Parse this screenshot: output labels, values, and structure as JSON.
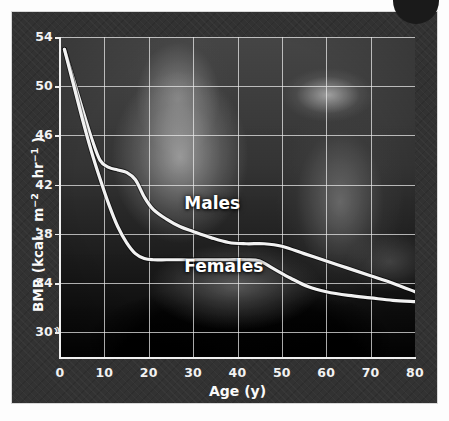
{
  "figure": {
    "panel_bg": "#323232",
    "curve_color": "#f2f2f2",
    "grid_color": "#ebebeb"
  },
  "corner": {
    "icon": "page-corner-dot"
  },
  "chart_data": {
    "type": "line",
    "title": "",
    "xlabel": "Age (y)",
    "ylabel": "BMR (kcal · m⁻² · hr⁻¹)",
    "ylabel_parts": {
      "prefix": "BMR (kcal · m",
      "sup1": "−2",
      "mid": " · hr",
      "sup2": "−1",
      "suffix": " )"
    },
    "xlim": [
      0,
      80
    ],
    "ylim": [
      28,
      54
    ],
    "grid": true,
    "axis_break": true,
    "axis_break_symbol": "≈",
    "legend_position": "inline-annotation",
    "xticks": [
      0,
      10,
      20,
      30,
      40,
      50,
      60,
      70,
      80
    ],
    "yticks": [
      30,
      34,
      38,
      42,
      46,
      50,
      54
    ],
    "series": [
      {
        "name": "Males",
        "color": "#f2f2f2",
        "label_x": 28,
        "label_y": 40.4,
        "x": [
          1,
          3,
          5,
          7,
          9,
          11,
          13,
          15,
          17,
          19,
          21,
          24,
          27,
          30,
          34,
          38,
          42,
          46,
          50,
          55,
          60,
          65,
          70,
          75,
          80
        ],
        "values": [
          53.0,
          50.6,
          48.2,
          45.9,
          44.0,
          43.4,
          43.2,
          43.0,
          42.4,
          41.0,
          40.0,
          39.2,
          38.6,
          38.2,
          37.7,
          37.3,
          37.2,
          37.2,
          37.0,
          36.4,
          35.8,
          35.2,
          34.6,
          34.0,
          33.3
        ]
      },
      {
        "name": "Females",
        "color": "#f2f2f2",
        "label_x": 28,
        "label_y": 35.3,
        "x": [
          1,
          3,
          5,
          7,
          9,
          11,
          13,
          15,
          17,
          19,
          21,
          24,
          27,
          30,
          34,
          38,
          42,
          45,
          48,
          52,
          56,
          60,
          65,
          70,
          75,
          80
        ],
        "values": [
          53.0,
          50.2,
          47.4,
          44.8,
          42.5,
          40.4,
          38.6,
          37.3,
          36.4,
          36.0,
          35.9,
          35.9,
          35.9,
          35.9,
          35.9,
          35.9,
          35.9,
          35.8,
          35.2,
          34.4,
          33.7,
          33.3,
          33.0,
          32.8,
          32.6,
          32.5
        ]
      }
    ]
  }
}
